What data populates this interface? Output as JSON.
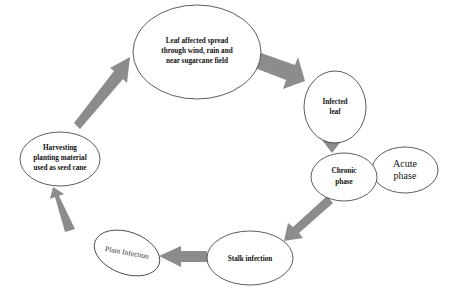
{
  "diagram": {
    "type": "cycle",
    "colors": {
      "arrow": "#8c8c8c",
      "stroke": "#333333",
      "fill": "#ffffff"
    },
    "nodes": {
      "leaf_spread": {
        "lines": [
          "Leaf affected spread",
          "through wind, rain and",
          "near sugarcane field"
        ]
      },
      "infected_leaf": {
        "lines": [
          "Infected",
          "leaf"
        ]
      },
      "chronic_phase": {
        "lines": [
          "Chronic",
          "phase"
        ]
      },
      "acute_phase": {
        "lines": [
          "Acute",
          "phase"
        ]
      },
      "stalk_infection": {
        "lines": [
          "Stalk infection"
        ]
      },
      "plant_infection": {
        "lines": [
          "Plant Infection"
        ]
      },
      "harvesting": {
        "lines": [
          "Harvesting",
          "planting material",
          "used as seed cane"
        ]
      }
    },
    "edges": [
      {
        "from": "leaf_spread",
        "to": "infected_leaf"
      },
      {
        "from": "infected_leaf",
        "to": "chronic_phase"
      },
      {
        "from": "chronic_phase",
        "to": "stalk_infection"
      },
      {
        "from": "stalk_infection",
        "to": "plant_infection"
      },
      {
        "from": "plant_infection",
        "to": "harvesting"
      },
      {
        "from": "harvesting",
        "to": "leaf_spread"
      }
    ]
  }
}
